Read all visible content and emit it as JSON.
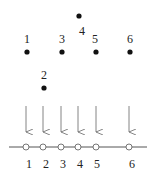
{
  "diagram": {
    "colors": {
      "ink": "#222222",
      "arrow": "#666666",
      "line": "#555555",
      "background": "#ffffff"
    },
    "points": [
      {
        "label": "1",
        "x": 27,
        "y": 52,
        "label_pos": "above"
      },
      {
        "label": "2",
        "x": 44,
        "y": 88,
        "label_pos": "above"
      },
      {
        "label": "3",
        "x": 62,
        "y": 52,
        "label_pos": "above"
      },
      {
        "label": "4",
        "x": 79,
        "y": 16,
        "label_pos": "below"
      },
      {
        "label": "5",
        "x": 96,
        "y": 52,
        "label_pos": "above"
      },
      {
        "label": "6",
        "x": 130,
        "y": 52,
        "label_pos": "above"
      }
    ],
    "projection": {
      "arrows_x": [
        26,
        43,
        61,
        78,
        96,
        129
      ],
      "line_y": 147,
      "ticks": [
        {
          "label": "1",
          "x": 26
        },
        {
          "label": "2",
          "x": 43
        },
        {
          "label": "3",
          "x": 61
        },
        {
          "label": "4",
          "x": 78
        },
        {
          "label": "5",
          "x": 96
        },
        {
          "label": "6",
          "x": 129
        }
      ]
    }
  }
}
